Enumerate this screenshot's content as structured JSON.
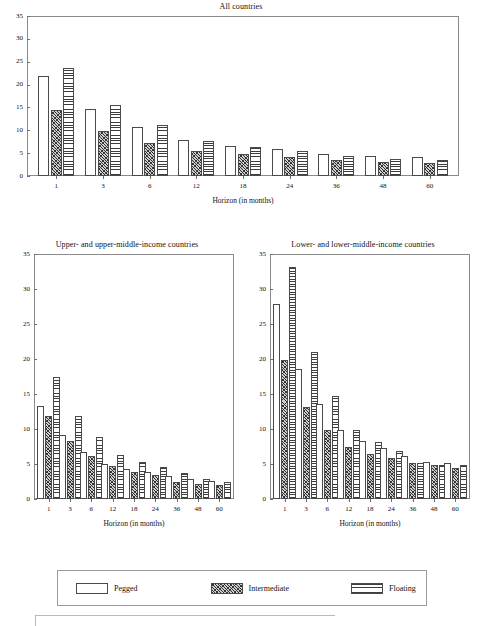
{
  "figure": {
    "axis_x_label": "Horizon (in months)",
    "y_ticks": [
      "0",
      "5",
      "10",
      "15",
      "20",
      "25",
      "30",
      "35"
    ],
    "x_ticks": [
      "1",
      "3",
      "6",
      "12",
      "18",
      "24",
      "36",
      "48",
      "60"
    ]
  },
  "legend": {
    "items": [
      {
        "label": "Pegged",
        "pattern": "dotted",
        "swatch_name": "legend-swatch-pegged"
      },
      {
        "label": "Intermediate",
        "pattern": "diagonal-hatch",
        "swatch_name": "legend-swatch-intermediate"
      },
      {
        "label": "Floating",
        "pattern": "horizontal-lines",
        "swatch_name": "legend-swatch-floating"
      }
    ]
  },
  "chart_data": [
    {
      "type": "bar",
      "title": "All countries",
      "xlabel": "Horizon (in months)",
      "ylabel": "",
      "categories": [
        "1",
        "3",
        "6",
        "12",
        "18",
        "24",
        "36",
        "48",
        "60"
      ],
      "ylim": [
        0,
        35
      ],
      "ytick_step": 5,
      "grid": false,
      "legend_position": "bottom-shared",
      "series": [
        {
          "name": "Pegged",
          "values": [
            21.8,
            14.6,
            10.8,
            7.9,
            6.6,
            5.9,
            4.9,
            4.3,
            4.2
          ]
        },
        {
          "name": "Intermediate",
          "values": [
            14.5,
            9.9,
            7.3,
            5.5,
            4.8,
            4.2,
            3.5,
            3.0,
            2.8
          ]
        },
        {
          "name": "Floating",
          "values": [
            23.6,
            15.6,
            11.2,
            7.7,
            6.3,
            5.4,
            4.3,
            3.8,
            3.6
          ]
        }
      ]
    },
    {
      "type": "bar",
      "title": "Upper- and upper-middle-income countries",
      "xlabel": "Horizon (in months)",
      "ylabel": "",
      "categories": [
        "1",
        "3",
        "6",
        "12",
        "18",
        "24",
        "36",
        "48",
        "60"
      ],
      "ylim": [
        0,
        35
      ],
      "ytick_step": 5,
      "grid": false,
      "legend_position": "bottom-shared",
      "series": [
        {
          "name": "Pegged",
          "values": [
            13.3,
            9.1,
            6.7,
            5.0,
            4.3,
            3.8,
            3.3,
            2.8,
            2.6
          ]
        },
        {
          "name": "Intermediate",
          "values": [
            11.9,
            8.3,
            6.1,
            4.7,
            3.9,
            3.4,
            2.5,
            2.1,
            2.0
          ]
        },
        {
          "name": "Floating",
          "values": [
            17.4,
            11.9,
            8.9,
            6.3,
            5.3,
            4.6,
            3.7,
            2.9,
            2.4
          ]
        }
      ]
    },
    {
      "type": "bar",
      "title": "Lower- and lower-middle-income countries",
      "xlabel": "Horizon (in months)",
      "ylabel": "",
      "categories": [
        "1",
        "3",
        "6",
        "12",
        "18",
        "24",
        "36",
        "48",
        "60"
      ],
      "ylim": [
        0,
        35
      ],
      "ytick_step": 5,
      "grid": false,
      "legend_position": "bottom-shared",
      "series": [
        {
          "name": "Pegged",
          "values": [
            27.9,
            18.6,
            13.6,
            9.8,
            8.3,
            7.3,
            6.1,
            5.3,
            5.2
          ]
        },
        {
          "name": "Intermediate",
          "values": [
            19.8,
            13.1,
            9.9,
            7.4,
            6.5,
            5.9,
            5.2,
            4.8,
            4.4
          ]
        },
        {
          "name": "Floating",
          "values": [
            33.1,
            21.0,
            14.7,
            9.8,
            8.2,
            6.8,
            5.2,
            4.9,
            4.9
          ]
        }
      ]
    }
  ]
}
